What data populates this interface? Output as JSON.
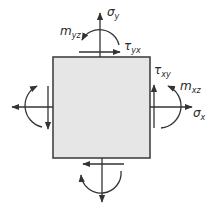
{
  "diagram": {
    "type": "stress-element",
    "element_fill": "#e6e6e6",
    "stroke_color": "#333333",
    "labels": {
      "sigma_y": {
        "base": "σ",
        "sub": "y"
      },
      "tau_yx": {
        "base": "τ",
        "sub": "yx"
      },
      "m_yz": {
        "base": "m",
        "sub": "yz"
      },
      "tau_xy": {
        "base": "τ",
        "sub": "xy"
      },
      "m_xz": {
        "base": "m",
        "sub": "xz"
      },
      "sigma_x": {
        "base": "σ",
        "sub": "x"
      }
    }
  }
}
